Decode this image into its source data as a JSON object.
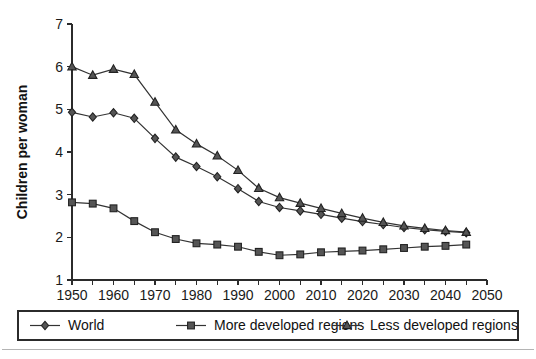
{
  "chart_data": {
    "type": "line",
    "title": "",
    "xlabel": "",
    "ylabel": "Children per woman",
    "x": [
      1950,
      1955,
      1960,
      1965,
      1970,
      1975,
      1980,
      1985,
      1990,
      1995,
      2000,
      2005,
      2010,
      2015,
      2020,
      2025,
      2030,
      2035,
      2040,
      2045
    ],
    "xlim": [
      1950,
      2050
    ],
    "ylim": [
      1,
      7
    ],
    "xticks": [
      1950,
      1955,
      1960,
      1965,
      1970,
      1975,
      1980,
      1985,
      1990,
      1995,
      2000,
      2005,
      2010,
      2015,
      2020,
      2025,
      2030,
      2035,
      2040,
      2045,
      2050
    ],
    "xticklabels": [
      "1950",
      "",
      "1960",
      "",
      "1970",
      "",
      "1980",
      "",
      "1990",
      "",
      "2000",
      "",
      "2010",
      "",
      "2020",
      "",
      "2030",
      "",
      "2040",
      "",
      "2050"
    ],
    "yticks": [
      1,
      2,
      3,
      4,
      5,
      6,
      7
    ],
    "yticklabels": [
      "1",
      "2",
      "3",
      "4",
      "5",
      "6",
      "7"
    ],
    "grid": false,
    "legend_position": "bottom",
    "series": [
      {
        "name": "World",
        "marker": "diamond",
        "values": [
          4.93,
          4.82,
          4.92,
          4.79,
          4.32,
          3.88,
          3.66,
          3.42,
          3.14,
          2.84,
          2.7,
          2.62,
          2.54,
          2.45,
          2.37,
          2.3,
          2.23,
          2.18,
          2.14,
          2.11
        ]
      },
      {
        "name": "More developed regions",
        "marker": "square",
        "values": [
          2.82,
          2.79,
          2.68,
          2.38,
          2.12,
          1.96,
          1.86,
          1.83,
          1.78,
          1.66,
          1.58,
          1.6,
          1.65,
          1.67,
          1.69,
          1.72,
          1.75,
          1.78,
          1.8,
          1.83
        ]
      },
      {
        "name": "Less developed regions",
        "marker": "triangle",
        "values": [
          6.0,
          5.8,
          5.94,
          5.82,
          5.17,
          4.52,
          4.19,
          3.91,
          3.57,
          3.15,
          2.93,
          2.8,
          2.68,
          2.56,
          2.45,
          2.35,
          2.27,
          2.21,
          2.16,
          2.12
        ]
      }
    ]
  },
  "legend": {
    "entries": [
      "World",
      "More developed regions",
      "Less developed regions"
    ]
  }
}
